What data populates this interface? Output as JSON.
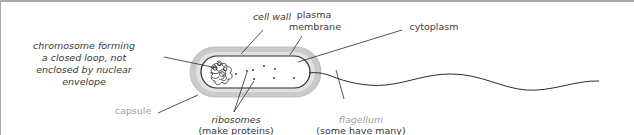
{
  "diagram": {
    "colors": {
      "line": "#2b2b2b",
      "capsule_fill": "#c8c8c8",
      "capsule_edge": "#b0b0b0",
      "cell_fill": "#ffffff",
      "muted_text": "#a0a0a0",
      "text": "#3a3a3a",
      "frame": "#a8a8a8"
    },
    "labels": {
      "cell_wall": "cell wall",
      "plasma_membrane_line1": "plasma",
      "plasma_membrane_line2": "membrane",
      "cytoplasm": "cytoplasm",
      "chromosome_line1": "chromosome forming",
      "chromosome_line2": "a closed loop, not",
      "chromosome_line3": "enclosed by nuclear",
      "chromosome_line4": "envelope",
      "capsule": "capsule",
      "ribosomes": "ribosomes",
      "ribosomes_note": "(make proteins)",
      "flagellum": "flagellum",
      "flagellum_note": "(some have many)"
    }
  }
}
